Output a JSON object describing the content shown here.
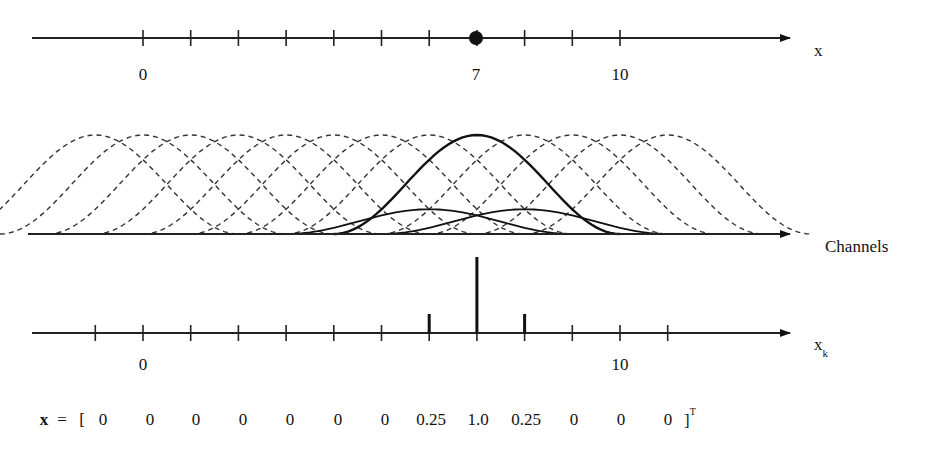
{
  "top_axis": {
    "name": "x",
    "tick_labels": [
      {
        "text": "0",
        "x": 143
      },
      {
        "text": "7",
        "x": 476
      },
      {
        "text": "10",
        "x": 620
      }
    ],
    "marked_value": 7
  },
  "channels_axis": {
    "label": "Channels",
    "channel_centers": [
      -1,
      0,
      1,
      2,
      3,
      4,
      5,
      6,
      7,
      8,
      9,
      10,
      11
    ],
    "active_channel": 7,
    "highlighted_neighbors": [
      6,
      8
    ],
    "neighbor_weight": 0.25
  },
  "bottom_axis": {
    "name": "x",
    "subscript": "k",
    "tick_labels": [
      {
        "text": "0",
        "x": 143
      },
      {
        "text": "10",
        "x": 620
      }
    ],
    "stems": [
      {
        "k": 6,
        "value": 0.25
      },
      {
        "k": 7,
        "value": 1.0
      },
      {
        "k": 8,
        "value": 0.25
      }
    ]
  },
  "vector": {
    "name": "x",
    "equals": "=",
    "open_bracket": "[",
    "close_bracket": "]",
    "transpose": "T",
    "values": [
      "0",
      "0",
      "0",
      "0",
      "0",
      "0",
      "0",
      "0.25",
      "1.0",
      "0.25",
      "0",
      "0",
      "0"
    ]
  },
  "chart_data": {
    "type": "line",
    "title": "",
    "x_axis": {
      "label": "x",
      "ticks": [
        0,
        7,
        10
      ],
      "marker": 7
    },
    "channels": {
      "label": "Channels",
      "centers": [
        -1,
        0,
        1,
        2,
        3,
        4,
        5,
        6,
        7,
        8,
        9,
        10,
        11
      ]
    },
    "series": [
      {
        "name": "channel responses",
        "x": [
          -1,
          0,
          1,
          2,
          3,
          4,
          5,
          6,
          7,
          8,
          9,
          10,
          11
        ],
        "values": [
          0,
          0,
          0,
          0,
          0,
          0,
          0,
          0.25,
          1.0,
          0.25,
          0,
          0,
          0
        ]
      }
    ],
    "xk_axis": {
      "label": "x_k",
      "ticks": [
        0,
        10
      ]
    }
  }
}
